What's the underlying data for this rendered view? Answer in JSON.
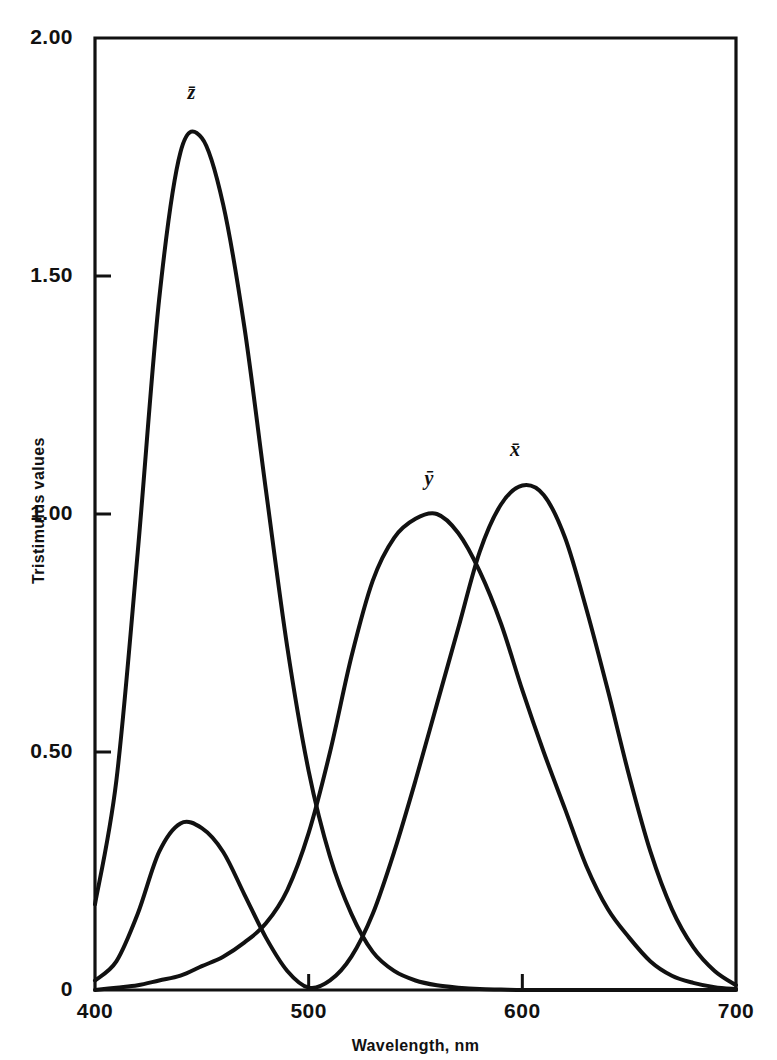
{
  "chart_data": {
    "type": "line",
    "title": "",
    "xlabel": "Wavelength, nm",
    "ylabel": "Tristimulus values",
    "xlim": [
      400,
      700
    ],
    "ylim": [
      0,
      2.0
    ],
    "xticks": [
      "400",
      "500",
      "600",
      "700"
    ],
    "yticks": [
      "0",
      "0.50",
      "1.00",
      "1.50",
      "2.00"
    ],
    "xtick_values": [
      400,
      500,
      600,
      700
    ],
    "ytick_values": [
      0,
      0.5,
      1.0,
      1.5,
      2.0
    ],
    "grid": false,
    "legend": "inline-curve-labels",
    "line_color": "#111111",
    "background_color": "#ffffff",
    "x": [
      400,
      410,
      420,
      430,
      440,
      450,
      460,
      470,
      480,
      490,
      500,
      510,
      520,
      530,
      540,
      550,
      560,
      570,
      580,
      590,
      600,
      610,
      620,
      630,
      640,
      650,
      660,
      670,
      680,
      690,
      700
    ],
    "series": [
      {
        "name": "x-bar",
        "label": "x̄",
        "label_x": 598,
        "label_y": 1.13,
        "peak_x": 598,
        "peak_y": 1.06,
        "secondary_peak_x": 442,
        "secondary_peak_y": 0.35,
        "values": [
          0.02,
          0.06,
          0.16,
          0.29,
          0.35,
          0.34,
          0.29,
          0.2,
          0.11,
          0.04,
          0.005,
          0.02,
          0.07,
          0.16,
          0.29,
          0.44,
          0.6,
          0.76,
          0.92,
          1.02,
          1.06,
          1.04,
          0.95,
          0.8,
          0.63,
          0.45,
          0.29,
          0.17,
          0.09,
          0.04,
          0.01
        ]
      },
      {
        "name": "y-bar",
        "label": "ȳ",
        "label_x": 558,
        "label_y": 1.07,
        "peak_x": 556,
        "peak_y": 1.0,
        "values": [
          0.0,
          0.005,
          0.01,
          0.02,
          0.03,
          0.05,
          0.07,
          0.1,
          0.14,
          0.21,
          0.33,
          0.5,
          0.7,
          0.86,
          0.95,
          0.99,
          1.0,
          0.96,
          0.88,
          0.77,
          0.63,
          0.5,
          0.38,
          0.26,
          0.17,
          0.11,
          0.06,
          0.03,
          0.015,
          0.006,
          0.002
        ]
      },
      {
        "name": "z-bar",
        "label": "z̄",
        "label_x": 447,
        "label_y": 1.88,
        "peak_x": 446,
        "peak_y": 1.79,
        "values": [
          0.18,
          0.44,
          0.92,
          1.45,
          1.76,
          1.79,
          1.65,
          1.39,
          1.05,
          0.72,
          0.46,
          0.28,
          0.16,
          0.08,
          0.04,
          0.02,
          0.01,
          0.005,
          0.002,
          0.001,
          0.0,
          0.0,
          0.0,
          0.0,
          0.0,
          0.0,
          0.0,
          0.0,
          0.0,
          0.0,
          0.0
        ]
      }
    ]
  },
  "axis": {
    "y_ticks": [
      {
        "label": "2.00",
        "value": 2.0
      },
      {
        "label": "1.50",
        "value": 1.5
      },
      {
        "label": "1.00",
        "value": 1.0
      },
      {
        "label": "0.50",
        "value": 0.5
      },
      {
        "label": "0",
        "value": 0.0
      }
    ],
    "x_ticks": [
      {
        "label": "400",
        "value": 400
      },
      {
        "label": "500",
        "value": 500
      },
      {
        "label": "600",
        "value": 600
      },
      {
        "label": "700",
        "value": 700
      }
    ],
    "x_title": "Wavelength, nm",
    "y_title": "Tristimulus values"
  },
  "curve_labels": [
    {
      "name": "z-bar",
      "text": "z̄"
    },
    {
      "name": "y-bar",
      "text": "ȳ"
    },
    {
      "name": "x-bar",
      "text": "x̄"
    }
  ]
}
